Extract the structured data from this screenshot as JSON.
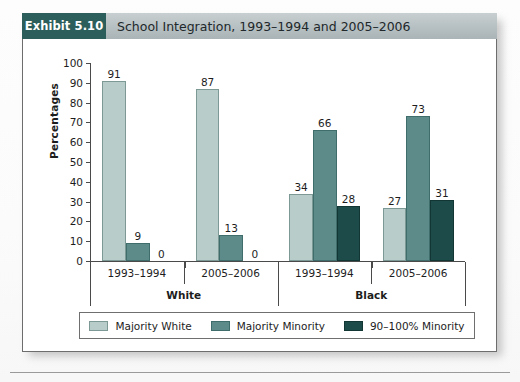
{
  "exhibit": {
    "badge_label": "Exhibit 5.10",
    "title": "School Integration, 1993–1994 and 2005–2006",
    "badge_color": "#2c5f5c",
    "title_bar_color": "#b9c2c4"
  },
  "chart_data": {
    "type": "bar",
    "title": "School Integration, 1993–1994 and 2005–2006",
    "xlabel": "",
    "ylabel": "Percentages",
    "ylim": [
      0,
      100
    ],
    "ytick_step": 10,
    "yticks": [
      100,
      90,
      80,
      70,
      60,
      50,
      40,
      30,
      20,
      10,
      0
    ],
    "grid": false,
    "legend_position": "bottom",
    "series": [
      {
        "name": "Majority White",
        "color": "#b8cdca",
        "values": [
          91,
          87,
          34,
          27
        ]
      },
      {
        "name": "Majority Minority",
        "color": "#5d8b89",
        "values": [
          9,
          13,
          66,
          73
        ]
      },
      {
        "name": "90–100% Minority",
        "color": "#1d4b49",
        "values": [
          0,
          0,
          28,
          31
        ]
      }
    ],
    "categories": [
      "1993–1994",
      "2005–2006",
      "1993–1994",
      "2005–2006"
    ],
    "groups": [
      {
        "label": "White",
        "subgroups": [
          {
            "label": "1993–1994",
            "values": [
              91,
              9,
              0
            ]
          },
          {
            "label": "2005–2006",
            "values": [
              87,
              13,
              0
            ]
          }
        ]
      },
      {
        "label": "Black",
        "subgroups": [
          {
            "label": "1993–1994",
            "values": [
              34,
              66,
              28
            ]
          },
          {
            "label": "2005–2006",
            "values": [
              27,
              73,
              31
            ]
          }
        ]
      }
    ]
  },
  "legend": {
    "items": [
      {
        "label": "Majority White"
      },
      {
        "label": "Majority Minority"
      },
      {
        "label": "90–100% Minority"
      }
    ]
  }
}
